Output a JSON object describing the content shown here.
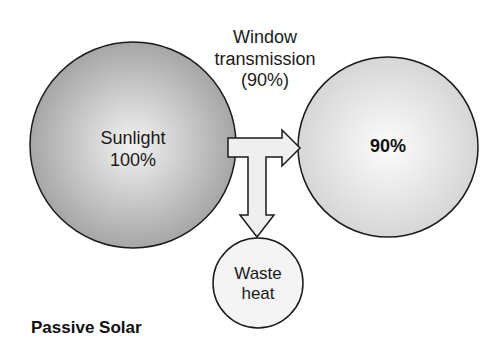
{
  "diagram": {
    "title": "Passive Solar",
    "source_node": {
      "label": "Sunlight",
      "value": "100%"
    },
    "transmission_label": {
      "line1": "Window",
      "line2": "transmission",
      "line3": "(90%)"
    },
    "output_node": {
      "value": "90%"
    },
    "waste_node": {
      "line1": "Waste",
      "line2": "heat"
    },
    "colors": {
      "source_fill_edge": "#a8a8a8",
      "source_fill_center": "#f0f0f0",
      "output_fill_edge": "#d8d8d8",
      "output_fill_center": "#fbfbfb",
      "arrow_fill": "#efefef",
      "stroke": "#1a1a1a"
    }
  }
}
